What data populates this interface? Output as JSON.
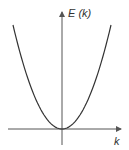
{
  "diagram": {
    "y_axis_label": "E (k)",
    "x_axis_label": "k",
    "curve": {
      "type": "parabola",
      "description": "E(k) proportional to k^2, minimum at origin",
      "k_range": [
        -1,
        1
      ],
      "vertex": [
        0,
        0
      ]
    },
    "colors": {
      "axis": "#555555",
      "curve": "#333333",
      "text": "#333333"
    }
  }
}
